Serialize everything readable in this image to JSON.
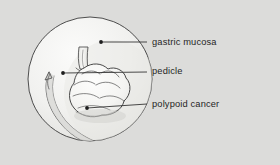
{
  "figure": {
    "kind": "medical-illustration",
    "background_color": "#dcdcda",
    "ink_color": "#2b2b2b",
    "label_color": "#252525",
    "circle": {
      "center_x": 90,
      "center_y": 79,
      "radius": 62,
      "fill": "#f2f2f0",
      "stroke": "#3a3a3a"
    },
    "annotations": [
      {
        "id": "gastric-mucosa",
        "label": "gastric mucosa",
        "dot_x": 101,
        "dot_y": 42,
        "leader_end_x": 147,
        "leader_end_y": 42
      },
      {
        "id": "pedicle",
        "label": "pedicle",
        "dot_x": 63,
        "dot_y": 73,
        "leader_end_x": 147,
        "leader_end_y": 72
      },
      {
        "id": "polypoid-cancer",
        "label": "polypoid cancer",
        "dot_x": 87,
        "dot_y": 108,
        "leader_end_x": 147,
        "leader_end_y": 104
      }
    ]
  }
}
